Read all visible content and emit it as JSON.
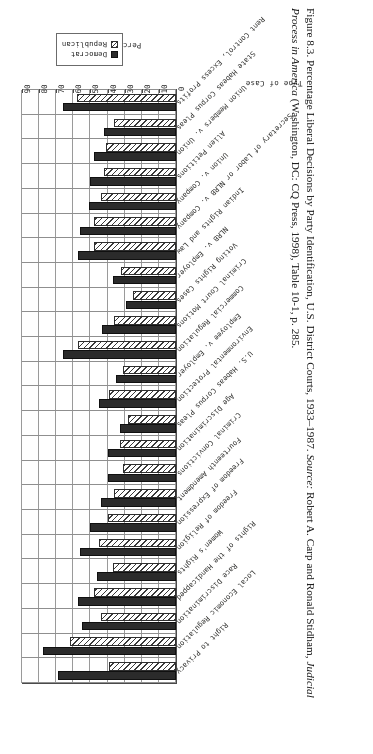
{
  "figure": {
    "caption_parts": {
      "number": "Figure 8.3.",
      "title": "Percentage Liberal Decisions by Party Identification, U.S. District Courts, 1933–1987.",
      "source_label": "Source:",
      "source_text_a": "Robert A. Carp and Ronald Stidham,",
      "source_title": "Judicial Process in America",
      "source_text_b": "(Washington, DC: CQ Press, 1998), Table 10-1, p. 285."
    },
    "orientation_note": "page-rotated-180"
  },
  "legend": {
    "position": "top-right",
    "items": [
      {
        "label": "Democrat",
        "swatch": "solid-black-swatch"
      },
      {
        "label": "Republican",
        "swatch": "hatched-swatch"
      }
    ]
  },
  "chart_data": {
    "type": "bar",
    "title": "Percentage Liberal Decisions by Party Identification, U.S. District Courts, 1933–1987.",
    "xlabel": "Type of Case",
    "ylabel": "Percentage Liberal",
    "ylim": [
      0,
      90
    ],
    "yticks": [
      0,
      10,
      20,
      30,
      40,
      50,
      60,
      70,
      80,
      90
    ],
    "grid": true,
    "legend_position": "top-right",
    "categories": [
      "Right to Privacy",
      "Local Economic Regulation",
      "Race Discrimination",
      "Rights of the Handicapped",
      "Women's Rights",
      "Freedom of Religion",
      "Freedom of Expression",
      "Fourteenth Amendment",
      "Criminal Convictions",
      "Age Discrimination",
      "U.S. Habeas Corpus Pleas",
      "Environmental Protection",
      "Employee v. Employer",
      "Commercial Regulation",
      "Criminal Court Motions",
      "Voting Rights Cases",
      "NLRB v. Employer",
      "Indian Rights and Law",
      "Secretary of Labor or NLRB v. Company",
      "Union v. Company",
      "Alien Petitions",
      "Union Members v. Union",
      "State Habeas Corpus Pleas",
      "Rent Control, Excess Profits"
    ],
    "series": [
      {
        "name": "Democrat",
        "color": "#2b2b2b",
        "values": [
          69,
          78,
          55,
          57,
          46,
          56,
          50,
          44,
          40,
          40,
          33,
          45,
          35,
          66,
          43,
          29,
          37,
          57,
          56,
          51,
          50,
          48,
          42,
          66
        ]
      },
      {
        "name": "Republican",
        "color": "#ffffff",
        "values": [
          39,
          62,
          44,
          48,
          37,
          45,
          40,
          36,
          31,
          33,
          28,
          39,
          31,
          57,
          36,
          25,
          32,
          48,
          48,
          44,
          42,
          41,
          36,
          58
        ]
      }
    ]
  }
}
